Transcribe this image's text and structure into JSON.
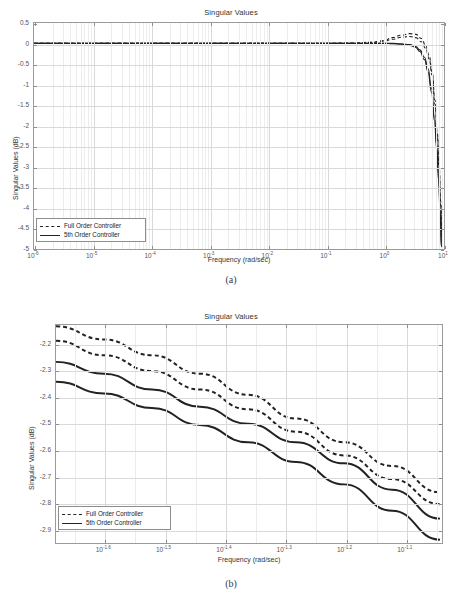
{
  "figures": [
    {
      "id": "a",
      "caption": "(a)",
      "chart_data": {
        "type": "line",
        "title": "Singular Values",
        "xlabel": "Frequency (rad/sec)",
        "ylabel": "Singular Values (dB)",
        "xscale": "log",
        "xlim": [
          1e-06,
          10
        ],
        "ylim": [
          -5,
          0.5
        ],
        "grid": true,
        "legend_position": "lower-left",
        "xticks": [
          {
            "base": "10",
            "exp": "-6"
          },
          {
            "base": "10",
            "exp": "-5"
          },
          {
            "base": "10",
            "exp": "-4"
          },
          {
            "base": "10",
            "exp": "-3"
          },
          {
            "base": "10",
            "exp": "-2"
          },
          {
            "base": "10",
            "exp": "-1"
          },
          {
            "base": "10",
            "exp": "0"
          },
          {
            "base": "10",
            "exp": "1"
          }
        ],
        "yticks": [
          "0.5",
          "0",
          "-0.5",
          "-1",
          "-1.5",
          "-2",
          "-2.5",
          "-3",
          "-3.5",
          "-4",
          "-4.5",
          "-5"
        ],
        "series": [
          {
            "name": "Full Order Controller",
            "style": "dashed",
            "color": "#222222",
            "points": [
              [
                -6,
                0.0
              ],
              [
                -4,
                0.0
              ],
              [
                -2,
                0.0
              ],
              [
                -1,
                0.0
              ],
              [
                -0.5,
                0.01
              ],
              [
                -0.2,
                0.03
              ],
              [
                0.0,
                0.07
              ],
              [
                0.15,
                0.14
              ],
              [
                0.3,
                0.2
              ],
              [
                0.45,
                0.24
              ],
              [
                0.55,
                0.22
              ],
              [
                0.65,
                0.12
              ],
              [
                0.72,
                -0.06
              ],
              [
                0.78,
                -0.3
              ],
              [
                0.83,
                -0.7
              ],
              [
                0.88,
                -1.4
              ],
              [
                0.92,
                -2.2
              ],
              [
                0.95,
                -3.0
              ],
              [
                0.98,
                -3.9
              ],
              [
                1.0,
                -4.8
              ]
            ]
          },
          {
            "name": "Full Order Controller",
            "style": "dashed",
            "color": "#222222",
            "points": [
              [
                -6,
                0.0
              ],
              [
                -4,
                0.0
              ],
              [
                -2,
                0.0
              ],
              [
                -1,
                0.0
              ],
              [
                -0.5,
                0.0
              ],
              [
                -0.2,
                0.02
              ],
              [
                0.0,
                0.05
              ],
              [
                0.15,
                0.1
              ],
              [
                0.3,
                0.15
              ],
              [
                0.45,
                0.17
              ],
              [
                0.55,
                0.14
              ],
              [
                0.65,
                0.04
              ],
              [
                0.72,
                -0.12
              ],
              [
                0.78,
                -0.38
              ],
              [
                0.83,
                -0.78
              ],
              [
                0.88,
                -1.5
              ],
              [
                0.92,
                -2.3
              ],
              [
                0.95,
                -3.1
              ],
              [
                0.98,
                -4.0
              ],
              [
                1.0,
                -4.9
              ]
            ]
          },
          {
            "name": "5th Order Controller",
            "style": "solid",
            "color": "#222222",
            "points": [
              [
                -6,
                0.0
              ],
              [
                -4,
                0.0
              ],
              [
                -2,
                0.0
              ],
              [
                -1,
                0.0
              ],
              [
                -0.5,
                0.0
              ],
              [
                -0.2,
                0.0
              ],
              [
                0.0,
                0.0
              ],
              [
                0.15,
                0.0
              ],
              [
                0.3,
                -0.01
              ],
              [
                0.45,
                -0.03
              ],
              [
                0.55,
                -0.08
              ],
              [
                0.62,
                -0.16
              ],
              [
                0.7,
                -0.34
              ],
              [
                0.76,
                -0.62
              ],
              [
                0.82,
                -1.1
              ],
              [
                0.87,
                -1.8
              ],
              [
                0.91,
                -2.5
              ],
              [
                0.94,
                -3.2
              ],
              [
                0.97,
                -4.1
              ],
              [
                0.99,
                -5.0
              ]
            ]
          },
          {
            "name": "5th Order Controller",
            "style": "solid",
            "color": "#222222",
            "points": [
              [
                -6,
                0.0
              ],
              [
                -4,
                0.0
              ],
              [
                -2,
                0.0
              ],
              [
                -1,
                0.0
              ],
              [
                -0.5,
                0.0
              ],
              [
                -0.2,
                0.0
              ],
              [
                0.0,
                0.0
              ],
              [
                0.15,
                -0.01
              ],
              [
                0.3,
                -0.02
              ],
              [
                0.45,
                -0.05
              ],
              [
                0.55,
                -0.1
              ],
              [
                0.62,
                -0.2
              ],
              [
                0.7,
                -0.4
              ],
              [
                0.76,
                -0.7
              ],
              [
                0.82,
                -1.2
              ],
              [
                0.87,
                -1.9
              ],
              [
                0.91,
                -2.6
              ],
              [
                0.94,
                -3.35
              ],
              [
                0.97,
                -4.25
              ],
              [
                0.99,
                -5.0
              ]
            ]
          }
        ],
        "legend": [
          {
            "label": "Full Order Controller",
            "style": "dashed"
          },
          {
            "label": "5th Order Controller",
            "style": "solid"
          }
        ]
      }
    },
    {
      "id": "b",
      "caption": "(b)",
      "chart_data": {
        "type": "line",
        "title": "Singular Values",
        "xlabel": "Frequency (rad/sec)",
        "ylabel": "Singular Values (dB)",
        "xscale": "log",
        "xlim": [
          -1.68,
          -1.04
        ],
        "ylim": [
          -2.95,
          -2.13
        ],
        "grid": true,
        "legend_position": "lower-left",
        "xticks": [
          {
            "base": "10",
            "exp": "-1.6"
          },
          {
            "base": "10",
            "exp": "-1.5"
          },
          {
            "base": "10",
            "exp": "-1.4"
          },
          {
            "base": "10",
            "exp": "-1.3"
          },
          {
            "base": "10",
            "exp": "-1.2"
          },
          {
            "base": "10",
            "exp": "-1.1"
          }
        ],
        "yticks": [
          "-2.2",
          "-2.3",
          "-2.4",
          "-2.5",
          "-2.6",
          "-2.7",
          "-2.8",
          "-2.9"
        ],
        "series": [
          {
            "name": "Full Order Controller",
            "style": "dashed",
            "color": "#222222",
            "points": [
              [
                -1.68,
                -2.135
              ],
              [
                -1.6,
                -2.185
              ],
              [
                -1.52,
                -2.245
              ],
              [
                -1.44,
                -2.315
              ],
              [
                -1.36,
                -2.395
              ],
              [
                -1.28,
                -2.485
              ],
              [
                -1.2,
                -2.575
              ],
              [
                -1.12,
                -2.665
              ],
              [
                -1.04,
                -2.765
              ]
            ]
          },
          {
            "name": "Full Order Controller",
            "style": "dashed",
            "color": "#222222",
            "points": [
              [
                -1.68,
                -2.19
              ],
              [
                -1.6,
                -2.245
              ],
              [
                -1.52,
                -2.305
              ],
              [
                -1.44,
                -2.375
              ],
              [
                -1.36,
                -2.45
              ],
              [
                -1.28,
                -2.535
              ],
              [
                -1.2,
                -2.625
              ],
              [
                -1.12,
                -2.715
              ],
              [
                -1.04,
                -2.81
              ]
            ]
          },
          {
            "name": "5th Order Controller",
            "style": "solid",
            "color": "#222222",
            "points": [
              [
                -1.68,
                -2.27
              ],
              [
                -1.6,
                -2.315
              ],
              [
                -1.52,
                -2.375
              ],
              [
                -1.44,
                -2.44
              ],
              [
                -1.36,
                -2.505
              ],
              [
                -1.28,
                -2.575
              ],
              [
                -1.2,
                -2.655
              ],
              [
                -1.12,
                -2.755
              ],
              [
                -1.04,
                -2.865
              ]
            ]
          },
          {
            "name": "5th Order Controller",
            "style": "solid",
            "color": "#222222",
            "points": [
              [
                -1.68,
                -2.345
              ],
              [
                -1.6,
                -2.39
              ],
              [
                -1.52,
                -2.445
              ],
              [
                -1.44,
                -2.51
              ],
              [
                -1.36,
                -2.575
              ],
              [
                -1.28,
                -2.65
              ],
              [
                -1.2,
                -2.735
              ],
              [
                -1.12,
                -2.835
              ],
              [
                -1.04,
                -2.945
              ]
            ]
          }
        ],
        "legend": [
          {
            "label": "Full Order Controller",
            "style": "dashed"
          },
          {
            "label": "5th Order Controller",
            "style": "solid"
          }
        ]
      }
    }
  ]
}
